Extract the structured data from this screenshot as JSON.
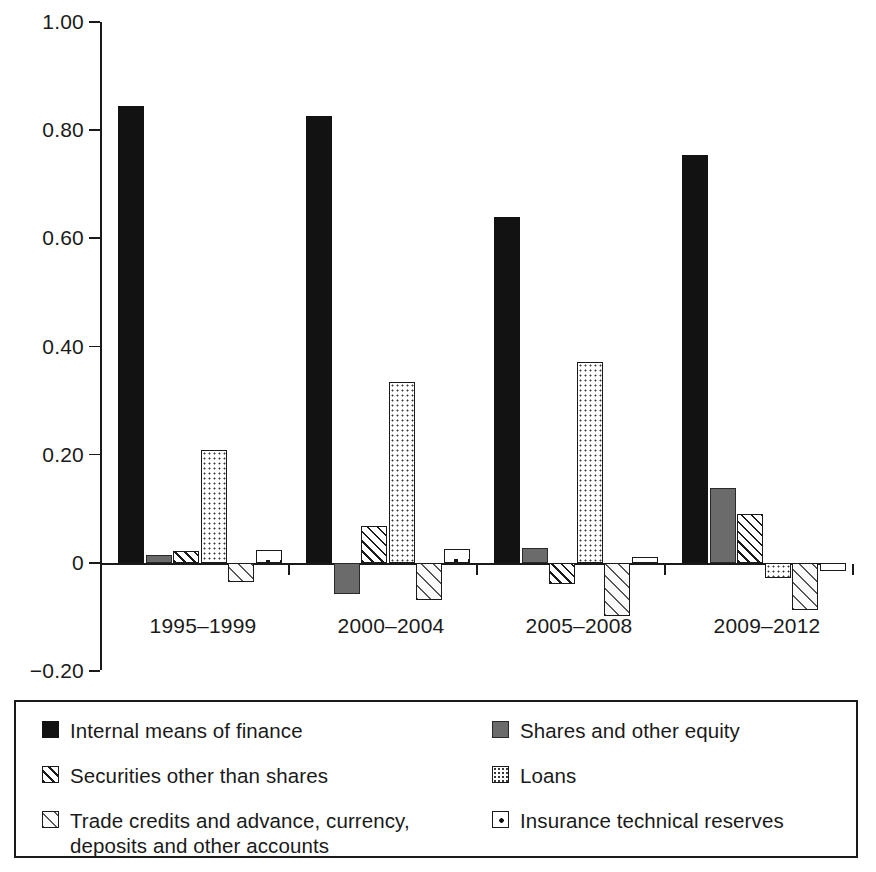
{
  "chart_data": {
    "type": "bar",
    "title": "",
    "subtitle": "",
    "xlabel": "",
    "ylabel": "",
    "categories": [
      "1995–1999",
      "2000–2004",
      "2005–2008",
      "2009–2012"
    ],
    "ylim": [
      -0.2,
      1.0
    ],
    "yticks": [
      1.0,
      0.8,
      0.6,
      0.4,
      0.2,
      0,
      -0.2
    ],
    "ytick_labels": [
      "1.00",
      "0.80",
      "0.60",
      "0.40",
      "0.20",
      "0",
      "−0.20"
    ],
    "grid": false,
    "legend_position": "bottom",
    "series": [
      {
        "name": "Internal means of finance",
        "pattern": "solid-black",
        "color": "#121212",
        "values": [
          0.845,
          0.827,
          0.639,
          0.755
        ]
      },
      {
        "name": "Shares and other equity",
        "pattern": "solid-gray",
        "color": "#6b6b6b",
        "values": [
          0.014,
          -0.058,
          0.028,
          0.139
        ]
      },
      {
        "name": "Securities other than shares",
        "pattern": "hatch",
        "color": "#ffffff",
        "values": [
          0.022,
          0.068,
          -0.038,
          0.09
        ]
      },
      {
        "name": "Loans",
        "pattern": "dots-fine",
        "color": "#ffffff",
        "values": [
          0.208,
          0.334,
          0.372,
          -0.027
        ]
      },
      {
        "name": "Trade credits and advance, currency, deposits and other accounts",
        "pattern": "hatch-light",
        "color": "#fafafa",
        "values": [
          -0.036,
          -0.069,
          -0.098,
          -0.086
        ]
      },
      {
        "name": "Insurance technical reserves",
        "pattern": "dots-box",
        "color": "#ffffff",
        "values": [
          0.024,
          0.026,
          0.012,
          -0.014
        ]
      }
    ]
  },
  "legend": {
    "left_column": [
      "Internal means of finance",
      "Securities other than shares",
      "Trade credits and advance, currency, deposits and other accounts"
    ],
    "right_column": [
      "Shares and other equity",
      "Loans",
      "Insurance technical reserves"
    ]
  }
}
